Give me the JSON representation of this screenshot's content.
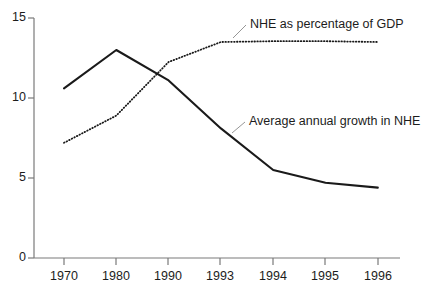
{
  "chart_data": {
    "type": "line",
    "title": "",
    "subtitle": "",
    "xlabel": "",
    "ylabel": "",
    "categories": [
      "1970",
      "1980",
      "1990",
      "1993",
      "1994",
      "1995",
      "1996"
    ],
    "ylim": [
      0,
      15
    ],
    "yticks": [
      0,
      5,
      10,
      15
    ],
    "ytick_labels": [
      "0",
      "5",
      "10",
      "15"
    ],
    "grid": false,
    "legend_position": "inline-annotation",
    "series": [
      {
        "name": "Average annual growth in NHE",
        "style": "solid",
        "color": "#1a1a1a",
        "values": [
          10.6,
          13.0,
          11.1,
          8.1,
          5.5,
          4.7,
          4.4
        ]
      },
      {
        "name": "NHE as percentage of GDP",
        "style": "dotted",
        "color": "#1a1a1a",
        "values": [
          7.2,
          8.9,
          12.25,
          13.5,
          13.55,
          13.55,
          13.5
        ]
      }
    ],
    "annotations": [
      {
        "text": "NHE as percentage of GDP",
        "series": "NHE as percentage of GDP",
        "leader_line": true
      },
      {
        "text": "Average annual growth in NHE",
        "series": "Average annual growth in NHE",
        "leader_line": true
      }
    ]
  },
  "axes": {
    "y_labels": [
      "15",
      "10",
      "5",
      "0"
    ],
    "x_labels": [
      "1970",
      "1980",
      "1990",
      "1993",
      "1994",
      "1995",
      "1996"
    ],
    "axis_color": "#6b6b6b"
  },
  "labels": {
    "nhe_gdp": "NHE as percentage of GDP",
    "avg_growth": "Average annual growth in NHE"
  }
}
